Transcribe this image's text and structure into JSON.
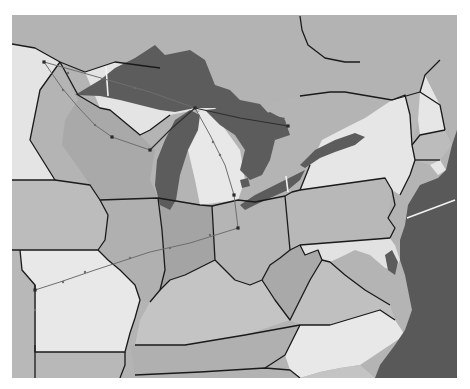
{
  "map": {
    "title": "Great Lakes and Northeastern United States",
    "frame": {
      "x": 12,
      "y": 15,
      "width": 445,
      "height": 363
    },
    "colors": {
      "background": "#ffffff",
      "canada": "#b4b4b4",
      "state_dark": "#a8a8a8",
      "state_mid": "#bdbdbd",
      "state_light": "#e6e6e6",
      "water": "#5c5c5c",
      "ocean": "#595959",
      "border": "#1a1a1a",
      "route": "#6e6e6e"
    },
    "regions": [
      {
        "name": "canada",
        "fill": "#b3b3b3",
        "points": "12,15 457,15 457,150 440,140 420,120 380,95 345,92 325,92 300,96 280,100 262,108 248,120 230,115 215,90 160,68 115,62 85,72 60,62 35,48 12,44"
      },
      {
        "name": "minnesota",
        "fill": "#e4e4e4",
        "points": "12,44 35,48 60,62 40,90 30,140 55,180 12,180"
      },
      {
        "name": "wisconsin",
        "fill": "#a9a9a9",
        "points": "60,62 78,95 100,108 110,110 140,135 155,150 150,180 158,198 100,200 90,185 80,170 62,145 65,120 78,100"
      },
      {
        "name": "michigan-up",
        "fill": "#e4e4e4",
        "points": "85,72 115,62 160,68 215,90 230,115 195,110 170,115 150,130 140,135 110,110 100,108"
      },
      {
        "name": "michigan-lp",
        "fill": "#e8e8e8",
        "points": "185,120 205,108 222,125 240,150 245,180 238,200 200,205 195,180 188,150"
      },
      {
        "name": "iowa",
        "fill": "#bcbcbc",
        "points": "12,180 55,180 90,185 100,200 108,215 105,240 98,250 20,250 12,250"
      },
      {
        "name": "illinois",
        "fill": "#b0b0b0",
        "points": "100,200 158,198 162,230 165,270 160,290 150,302 140,300 135,285 120,270 108,260 98,250 105,240 108,215"
      },
      {
        "name": "indiana",
        "fill": "#a4a4a4",
        "points": "158,198 200,205 212,206 215,260 205,265 185,275 170,280 160,290 165,270 162,230"
      },
      {
        "name": "ohio",
        "fill": "#b5b5b5",
        "points": "212,206 238,200 255,202 285,196 290,250 280,258 270,265 262,280 250,285 235,280 215,260"
      },
      {
        "name": "missouri",
        "fill": "#e8e8e8",
        "points": "20,250 98,250 108,260 120,270 135,285 140,300 135,318 130,333 125,352 35,352 35,285 22,270"
      },
      {
        "name": "kansas-nebraska-edge",
        "fill": "#b8b8b8",
        "points": "12,250 20,250 22,270 35,285 35,378 12,378"
      },
      {
        "name": "kentucky",
        "fill": "#c4c4c4",
        "points": "150,302 160,290 170,280 185,275 205,265 215,260 235,280 250,285 262,280 275,300 290,320 245,335 185,345 135,345 140,320"
      },
      {
        "name": "tennessee",
        "fill": "#b0b0b0",
        "points": "130,345 185,345 245,335 300,325 285,355 265,368 200,372 135,375"
      },
      {
        "name": "arkansas",
        "fill": "#b8b8b8",
        "points": "35,352 125,352 125,365 120,378 35,378"
      },
      {
        "name": "mississippi-alabama-edge",
        "fill": "#b3b3b3",
        "points": "120,378 125,365 135,375 200,372 265,368 290,370 300,378"
      },
      {
        "name": "west-virginia",
        "fill": "#a9a9a9",
        "points": "275,300 262,280 270,265 280,258 290,250 300,245 305,255 318,250 322,260 310,280 300,300 290,320"
      },
      {
        "name": "virginia",
        "fill": "#c0c0c0",
        "points": "290,320 300,300 310,280 322,260 330,262 345,275 365,290 390,305 395,320 380,310 330,325 300,325"
      },
      {
        "name": "north-carolina",
        "fill": "#e8e8e8",
        "points": "300,325 330,325 380,310 395,320 405,335 390,345 375,355 360,365 340,368 320,372 300,378 290,370 285,355"
      },
      {
        "name": "south-carolina-edge",
        "fill": "#c4c4c4",
        "points": "300,378 320,372 340,368 360,365 375,378"
      },
      {
        "name": "pennsylvania",
        "fill": "#b8b8b8",
        "points": "285,196 292,192 300,190 385,178 392,190 395,205 388,218 395,228 390,238 300,245 290,250"
      },
      {
        "name": "maryland",
        "fill": "#e2e2e2",
        "points": "300,245 390,238 395,245 400,260 395,270 385,268 370,255 355,250 345,255 330,262 322,260 318,250 305,255"
      },
      {
        "name": "delaware-nj",
        "fill": "#b3b3b3",
        "points": "388,218 392,190 400,195 408,205 405,225 400,240 395,245 390,238 395,228"
      },
      {
        "name": "new-york",
        "fill": "#e6e6e6",
        "points": "300,190 310,165 322,140 345,128 365,118 392,100 405,95 410,115 412,145 415,160 410,175 400,195 392,190 385,178"
      },
      {
        "name": "vermont",
        "fill": "#b9b9b9",
        "points": "392,100 420,92 418,120 412,145 410,115 405,95"
      },
      {
        "name": "new-hampshire",
        "fill": "#e6e6e6",
        "points": "420,92 425,75 440,105 445,130 420,135 418,120"
      },
      {
        "name": "maine-edge",
        "fill": "#b3b3b3",
        "points": "425,75 440,60 457,55 457,130 445,130 440,105"
      },
      {
        "name": "massachusetts-ct",
        "fill": "#bcbcbc",
        "points": "412,145 420,135 445,130 452,145 440,160 430,165 415,160"
      },
      {
        "name": "long-island-ri",
        "fill": "#e6e6e6",
        "points": "430,165 440,160 446,170 438,175"
      }
    ],
    "water": [
      {
        "name": "lake-superior",
        "points": "75,95 100,80 115,68 135,58 155,45 165,55 190,50 205,60 215,85 230,90 240,100 260,104 270,115 285,118 280,128 250,125 230,118 215,108 195,108 175,112 160,110 140,105 120,100 100,96"
      },
      {
        "name": "lake-michigan",
        "points": "175,120 190,110 200,115 198,130 188,150 180,175 176,200 170,210 160,205 155,185 157,160 165,140"
      },
      {
        "name": "lake-huron",
        "points": "205,110 225,108 250,118 265,125 275,140 270,160 262,175 250,180 240,170 245,150 235,135 220,125"
      },
      {
        "name": "georgian-bay",
        "points": "250,118 270,112 285,120 290,135 275,140 262,128"
      },
      {
        "name": "lake-erie",
        "points": "240,205 255,195 275,185 295,175 305,170 300,180 288,190 270,198 255,205 245,210"
      },
      {
        "name": "lake-ontario",
        "points": "300,165 315,150 335,140 355,133 365,137 355,145 335,152 320,158 305,168"
      },
      {
        "name": "lake-st-clair",
        "points": "240,180 248,178 250,186 242,188"
      },
      {
        "name": "chesapeake",
        "points": "385,255 392,250 398,262 395,275 388,270"
      }
    ],
    "ocean": {
      "name": "atlantic-ocean",
      "points": "457,130 452,145 446,170 438,178 420,185 408,205 405,225 400,240 400,260 405,275 408,290 412,310 405,330 395,345 380,365 375,378 457,378"
    },
    "borders": [
      "12,44 35,48 60,62 85,72 115,62 160,68",
      "60,62 40,90 30,140 55,180 12,180",
      "60,62 78,95 100,108 110,110 140,135 150,130 170,115",
      "55,180 90,185 100,200 158,198 200,205 212,206 238,200 255,202 285,196",
      "100,200 108,215 105,240 98,250 20,250 12,250",
      "98,250 108,260 120,270 135,285 140,300 135,318 130,333 125,352 35,352 35,285 22,270 20,250",
      "35,285 35,378",
      "158,198 162,230 165,270 160,290 150,302",
      "212,206 215,260 205,265 185,275 170,280 160,290",
      "215,260 235,280 250,285 262,280 270,265 280,258 290,250 285,196",
      "135,345 185,345 245,335 300,325 330,325 380,310 395,320",
      "125,352 125,365 120,378",
      "135,375 200,372 265,368 290,370 300,378",
      "300,325 285,355 265,368",
      "262,280 275,300 290,320 300,300 310,280 322,260 330,262 345,275 365,290 390,305",
      "290,250 300,245 390,238",
      "300,245 305,255 318,250 322,260",
      "285,196 292,192 300,190 385,178 392,190 395,205 388,218 395,228 390,238",
      "300,190 310,165",
      "392,100 405,95 410,115 412,145 415,160 410,175 400,195",
      "345,92 392,100 420,92 440,105 445,130",
      "420,92 425,75 440,60",
      "412,145 420,135 445,130",
      "415,160 440,160",
      "300,16 302,30 308,45 325,58 345,62 360,62",
      "300,96 330,92 345,92"
    ],
    "canals": [
      {
        "x1": 106,
        "y1": 66,
        "x2": 108,
        "y2": 96
      },
      {
        "x1": 286,
        "y1": 176,
        "x2": 288,
        "y2": 192
      },
      {
        "x1": 407,
        "y1": 218,
        "x2": 455,
        "y2": 200
      }
    ],
    "routes": [
      {
        "name": "duluth-wisconsin-route",
        "points": "44,62 62,88 78,107 95,125 112,137 150,150",
        "style": "route"
      },
      {
        "name": "wisconsin-mackinac-route",
        "points": "150,150 172,128 195,108",
        "style": "route-dark"
      },
      {
        "name": "duluth-mackinac-route",
        "points": "44,62 80,72 115,82 150,92 195,108",
        "style": "route"
      },
      {
        "name": "mackinac-east-route",
        "points": "195,108 240,118 288,126",
        "style": "route-dark"
      },
      {
        "name": "mackinac-toledo-route",
        "points": "195,108 210,135 225,165 234,195",
        "style": "route"
      },
      {
        "name": "toledo-columbus-route",
        "points": "234,195 238,228",
        "style": "route"
      },
      {
        "name": "columbus-missouri-route",
        "points": "238,228 190,243 150,252 95,270 60,282 35,290",
        "style": "route"
      },
      {
        "name": "missouri-south-route",
        "points": "35,290 35,345",
        "style": "route"
      }
    ],
    "nodes": [
      {
        "name": "duluth",
        "x": 44,
        "y": 62
      },
      {
        "name": "wisconsin-stop",
        "x": 112,
        "y": 137
      },
      {
        "name": "green-bay",
        "x": 150,
        "y": 150
      },
      {
        "name": "mackinac",
        "x": 195,
        "y": 108
      },
      {
        "name": "lake-huron-east",
        "x": 288,
        "y": 126
      },
      {
        "name": "toledo",
        "x": 234,
        "y": 195
      },
      {
        "name": "columbus",
        "x": 238,
        "y": 228
      },
      {
        "name": "missouri-border",
        "x": 35,
        "y": 290
      }
    ],
    "ticks": [
      {
        "x": 68,
        "y": 73
      },
      {
        "x": 135,
        "y": 88
      },
      {
        "x": 63,
        "y": 90
      },
      {
        "x": 95,
        "y": 125
      },
      {
        "x": 220,
        "y": 155
      },
      {
        "x": 213,
        "y": 142
      },
      {
        "x": 210,
        "y": 235
      },
      {
        "x": 170,
        "y": 248
      },
      {
        "x": 130,
        "y": 258
      },
      {
        "x": 85,
        "y": 272
      },
      {
        "x": 63,
        "y": 282
      },
      {
        "x": 35,
        "y": 310
      }
    ]
  }
}
